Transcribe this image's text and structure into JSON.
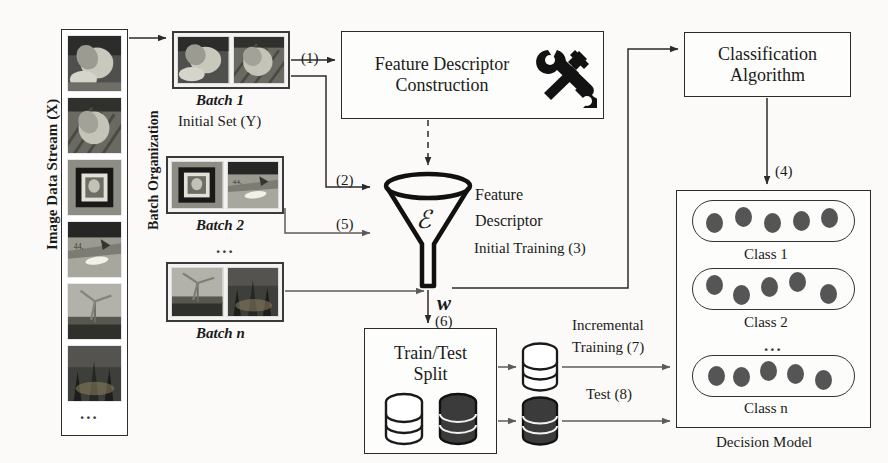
{
  "diagram": {
    "left_axis_label": "Image Data Stream (X)",
    "batch_org_label": "Batch Organization",
    "stream_ellipsis": "...",
    "batches": [
      {
        "caption": "Batch 1",
        "subcaption": "Initial Set (Y)",
        "images": [
          "flower-closeup",
          "flower-striped"
        ]
      },
      {
        "caption": "Batch 2",
        "subcaption": "...",
        "images": [
          "framed-picture",
          "boat-water"
        ]
      },
      {
        "caption": "Batch n",
        "subcaption": "",
        "images": [
          "wind-turbine",
          "city-night"
        ]
      }
    ],
    "boxes": {
      "feature_descriptor_construction": {
        "line1": "Feature Descriptor",
        "line2": "Construction",
        "icon": "hammer-wrench-icon"
      },
      "classification_algorithm": {
        "line1": "Classification",
        "line2": "Algorithm"
      },
      "train_test_split": {
        "line1": "Train/Test",
        "line2": "Split"
      },
      "decision_model": {
        "caption": "Decision Model"
      }
    },
    "funnel": {
      "symbol": "ℰ",
      "label_line1": "Feature",
      "label_line2": "Descriptor",
      "output_symbol": "w⃗"
    },
    "edges": [
      {
        "id": "1",
        "label": "(1)"
      },
      {
        "id": "2",
        "label": "(2)"
      },
      {
        "id": "3",
        "label": "Initial Training (3)"
      },
      {
        "id": "4",
        "label": "(4)"
      },
      {
        "id": "5",
        "label": "(5)"
      },
      {
        "id": "6",
        "label": "(6)"
      },
      {
        "id": "7",
        "label_line1": "Incremental",
        "label_line2": "Training (7)"
      },
      {
        "id": "8",
        "label": "Test (8)"
      }
    ],
    "classes": [
      {
        "label": "Class 1",
        "dot_count": 5,
        "dot_offsets": [
          4,
          -3,
          3,
          1,
          -2
        ]
      },
      {
        "label": "Class 2",
        "dot_count": 5,
        "dot_offsets": [
          -2,
          6,
          0,
          -4,
          4
        ]
      },
      {
        "label": "Class n",
        "dot_count": 5,
        "dot_offsets": [
          2,
          4,
          -3,
          1,
          5
        ]
      }
    ],
    "class_ellipsis": "...",
    "colors": {
      "ink": "#1a1a1a",
      "line": "#4a4a4a",
      "dot": "#555555",
      "paper": "#fbfaf8"
    }
  }
}
